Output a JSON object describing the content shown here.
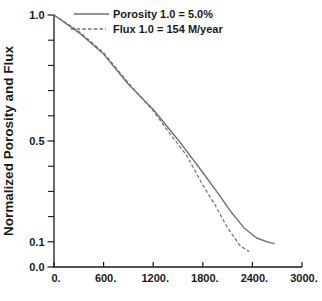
{
  "figure": {
    "background": "#ffffff",
    "axis_color": "#1a1a1a",
    "curve_color": "#6e6e6e"
  },
  "chart_data": {
    "type": "line",
    "title": "",
    "xlabel": "",
    "ylabel": "Normalized Porosity and Flux",
    "xlim": [
      0,
      3000
    ],
    "ylim": [
      0.0,
      1.0
    ],
    "grid": false,
    "legend_position": "top-inside",
    "x_ticks": [
      {
        "value": 0,
        "label": "0."
      },
      {
        "value": 600,
        "label": "600."
      },
      {
        "value": 1200,
        "label": "1200."
      },
      {
        "value": 1800,
        "label": "1800."
      },
      {
        "value": 2400,
        "label": "2400."
      },
      {
        "value": 3000,
        "label": "3000."
      }
    ],
    "y_ticks": [
      {
        "value": 1.0,
        "label": "1.0"
      },
      {
        "value": 0.5,
        "label": "0.5"
      },
      {
        "value": 0.1,
        "label": "0.1"
      },
      {
        "value": 0.0,
        "label": "0.0"
      }
    ],
    "y_minor_ticks": [
      0.9,
      0.8,
      0.7,
      0.6,
      0.4,
      0.3,
      0.2
    ],
    "series": [
      {
        "name": "Porosity 1.0 = 5.0%",
        "line": "solid",
        "color": "#6e6e6e",
        "x": [
          0,
          300,
          600,
          900,
          1200,
          1500,
          1800,
          2000,
          2150,
          2300,
          2450,
          2600,
          2670
        ],
        "y": [
          1.0,
          0.93,
          0.845,
          0.725,
          0.625,
          0.505,
          0.375,
          0.285,
          0.215,
          0.155,
          0.115,
          0.098,
          0.093
        ]
      },
      {
        "name": "Flux 1.0 = 154 M/year",
        "line": "dashed",
        "color": "#6e6e6e",
        "x": [
          0,
          300,
          600,
          900,
          1200,
          1400,
          1600,
          1800,
          1950,
          2100,
          2250,
          2360
        ],
        "y": [
          1.0,
          0.935,
          0.85,
          0.73,
          0.62,
          0.53,
          0.445,
          0.325,
          0.245,
          0.155,
          0.085,
          0.062
        ]
      }
    ]
  }
}
